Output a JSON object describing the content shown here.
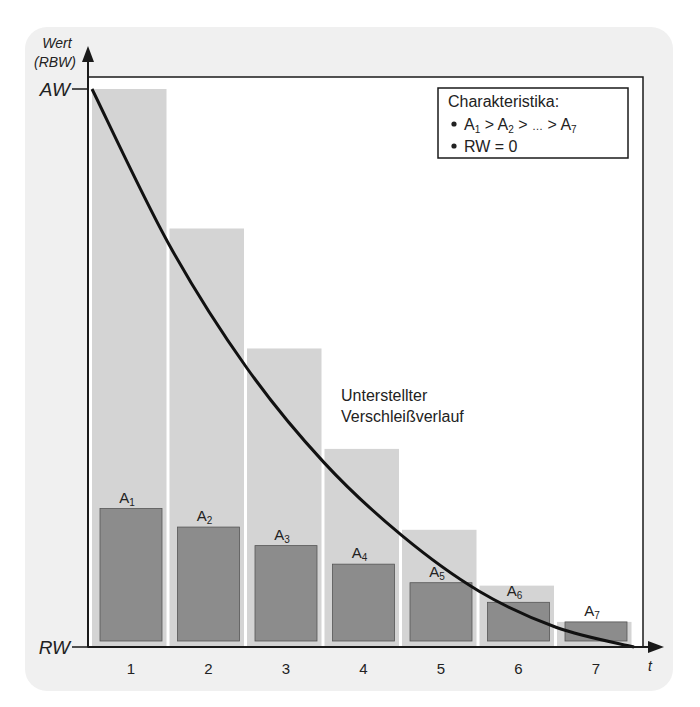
{
  "chart_data": {
    "type": "bar",
    "title": "",
    "xlabel": "t",
    "ylabel": "Wert (RBW)",
    "ylabel_lines": [
      "Wert",
      "(RBW)"
    ],
    "y_ticks": [
      {
        "label": "AW",
        "value": 1.0
      },
      {
        "label": "RW",
        "value": 0.0
      }
    ],
    "ylim": [
      0,
      1
    ],
    "categories": [
      "1",
      "2",
      "3",
      "4",
      "5",
      "6",
      "7"
    ],
    "series": [
      {
        "name": "Restbuchwert (Periodenbeginn)",
        "color": "#d4d4d4",
        "values": [
          1.0,
          0.75,
          0.535,
          0.355,
          0.21,
          0.11,
          0.045
        ]
      },
      {
        "name": "Abschreibung A",
        "color": "#8c8c8c",
        "labels": [
          "A1",
          "A2",
          "A3",
          "A4",
          "A5",
          "A6",
          "A7"
        ],
        "values": [
          0.25,
          0.215,
          0.18,
          0.145,
          0.11,
          0.073,
          0.036
        ]
      }
    ],
    "curve": {
      "name": "Unterstellter Verschleißverlauf",
      "label_lines": [
        "Unterstellter",
        "Verschleißverlauf"
      ],
      "shape": "convex decreasing from AW at t=0 to RW at t=7",
      "points": [
        [
          0,
          1.0
        ],
        [
          1,
          0.72
        ],
        [
          2,
          0.5
        ],
        [
          3,
          0.33
        ],
        [
          4,
          0.2
        ],
        [
          5,
          0.1
        ],
        [
          6,
          0.035
        ],
        [
          7,
          0.0
        ]
      ]
    },
    "legend": {
      "title": "Charakteristika:",
      "items": [
        {
          "parts": [
            [
              "A",
              "1"
            ],
            " > ",
            [
              "A",
              "2"
            ],
            " > … > ",
            [
              "A",
              "7"
            ]
          ],
          "text": "A1 > A2 > … > A7"
        },
        {
          "text": "RW = 0"
        }
      ],
      "position": "top-right"
    },
    "grid": false
  },
  "colors": {
    "panel": "#f0f0f0",
    "plot_bg": "#ffffff",
    "light_bar": "#d4d4d4",
    "dark_bar": "#8c8c8c",
    "axis": "#1a1a1a"
  }
}
